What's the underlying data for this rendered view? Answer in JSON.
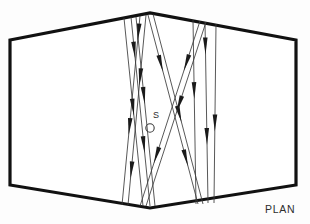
{
  "figure": {
    "caption": "PLAN",
    "source_label": "S",
    "background_color": "#fdfdfd",
    "outline_color": "#111111",
    "ray_color": "#3a3a3a",
    "arrow_color": "#1a1a1a"
  },
  "chart_data": {
    "type": "diagram",
    "title": "PLAN",
    "subtitle": "",
    "xlabel": "",
    "ylabel": "",
    "annotations": [
      "S",
      "PLAN"
    ],
    "room_outline": {
      "name": "hall-plan-outline",
      "shape": "hexagon",
      "vertices": [
        [
          10,
          40
        ],
        [
          150,
          13
        ],
        [
          296,
          40
        ],
        [
          296,
          185
        ],
        [
          150,
          208
        ],
        [
          10,
          185
        ]
      ]
    },
    "source": {
      "name": "sound-source",
      "label": "S",
      "marker_x": 150,
      "marker_y": 128,
      "marker_radius": 4.2,
      "label_x": 153,
      "label_y": 118
    },
    "rays": [
      {
        "id": "r1",
        "x1": 131,
        "y1": 17,
        "x2": 150,
        "y2": 206,
        "heads": [
          0.22,
          0.72
        ]
      },
      {
        "id": "r2",
        "x1": 136,
        "y1": 17,
        "x2": 155,
        "y2": 206,
        "heads": [
          0.46
        ]
      },
      {
        "id": "r3",
        "x1": 140,
        "y1": 16,
        "x2": 122,
        "y2": 205,
        "heads": [
          0.13,
          0.63
        ]
      },
      {
        "id": "r4",
        "x1": 146,
        "y1": 15,
        "x2": 128,
        "y2": 205,
        "heads": [
          0.37,
          0.86
        ]
      },
      {
        "id": "r5",
        "x1": 124,
        "y1": 18,
        "x2": 143,
        "y2": 206,
        "heads": [
          0.52
        ]
      },
      {
        "id": "r6",
        "x1": 148,
        "y1": 15,
        "x2": 198,
        "y2": 204,
        "heads": [
          0.3,
          0.8
        ]
      },
      {
        "id": "r7",
        "x1": 153,
        "y1": 14,
        "x2": 203,
        "y2": 204,
        "heads": [
          0.57
        ]
      },
      {
        "id": "r8",
        "x1": 200,
        "y1": 21,
        "x2": 140,
        "y2": 206,
        "heads": [
          0.27,
          0.77
        ]
      },
      {
        "id": "r9",
        "x1": 206,
        "y1": 22,
        "x2": 146,
        "y2": 206,
        "heads": [
          0.49
        ]
      },
      {
        "id": "r10",
        "x1": 193,
        "y1": 20,
        "x2": 196,
        "y2": 204,
        "heads": [
          0.43
        ]
      },
      {
        "id": "r11",
        "x1": 205,
        "y1": 22,
        "x2": 208,
        "y2": 203,
        "heads": [
          0.18,
          0.68
        ]
      },
      {
        "id": "r12",
        "x1": 216,
        "y1": 24,
        "x2": 214,
        "y2": 203,
        "heads": [
          0.6
        ]
      }
    ],
    "caption": {
      "text": "PLAN",
      "x": 265,
      "y": 203
    }
  }
}
